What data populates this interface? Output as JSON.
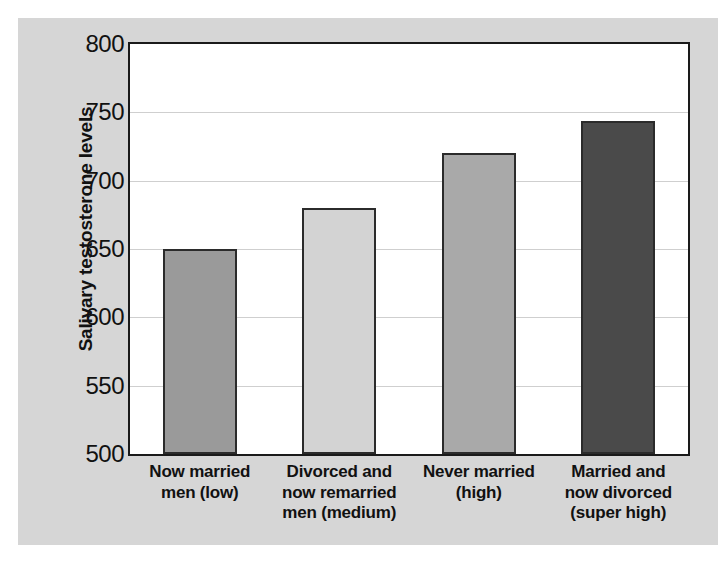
{
  "chart_data": {
    "type": "bar",
    "title": "",
    "subtitle": "",
    "xlabel": "",
    "ylabel": "Salivary testosterone levels",
    "ylim": [
      500,
      800
    ],
    "yticks": [
      500,
      550,
      600,
      650,
      700,
      750,
      800
    ],
    "ytick_labels": [
      "500",
      "550",
      "600",
      "650",
      "700",
      "750",
      "800"
    ],
    "grid": true,
    "legend": false,
    "legend_position": "none",
    "categories": [
      "Now married men (low)",
      "Divorced and now remarried men (medium)",
      "Never married (high)",
      "Married and now divorced (super high)"
    ],
    "category_lines": [
      [
        "Now married",
        "men (low)"
      ],
      [
        "Divorced and",
        "now remarried",
        "men (medium)"
      ],
      [
        "Never married",
        "(high)"
      ],
      [
        "Married and",
        "now divorced",
        "(super high)"
      ]
    ],
    "values": [
      650,
      680,
      720,
      744
    ],
    "bar_colors": [
      "#9a9a9a",
      "#d3d3d3",
      "#a9a9a9",
      "#4a4a4a"
    ],
    "bar_edge_color": "#2b2b2b",
    "plot_background": "#ffffff",
    "figure_background": "#d6d6d6",
    "gridline_color": "#cfcfcf"
  }
}
